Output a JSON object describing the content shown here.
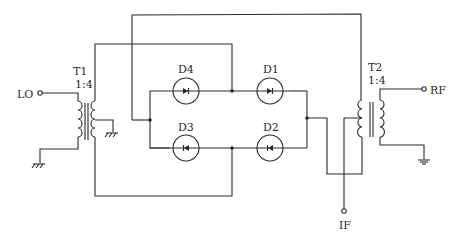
{
  "diagram": {
    "type": "double-balanced diode ring mixer",
    "ports": {
      "lo": "LO",
      "rf": "RF",
      "if": "IF"
    },
    "transformers": [
      {
        "name": "T1",
        "ratio": "1:4"
      },
      {
        "name": "T2",
        "ratio": "1:4"
      }
    ],
    "diodes": [
      {
        "name": "D1"
      },
      {
        "name": "D2"
      },
      {
        "name": "D3"
      },
      {
        "name": "D4"
      }
    ],
    "line_color": "#2a2a2a",
    "background": "#ffffff"
  }
}
